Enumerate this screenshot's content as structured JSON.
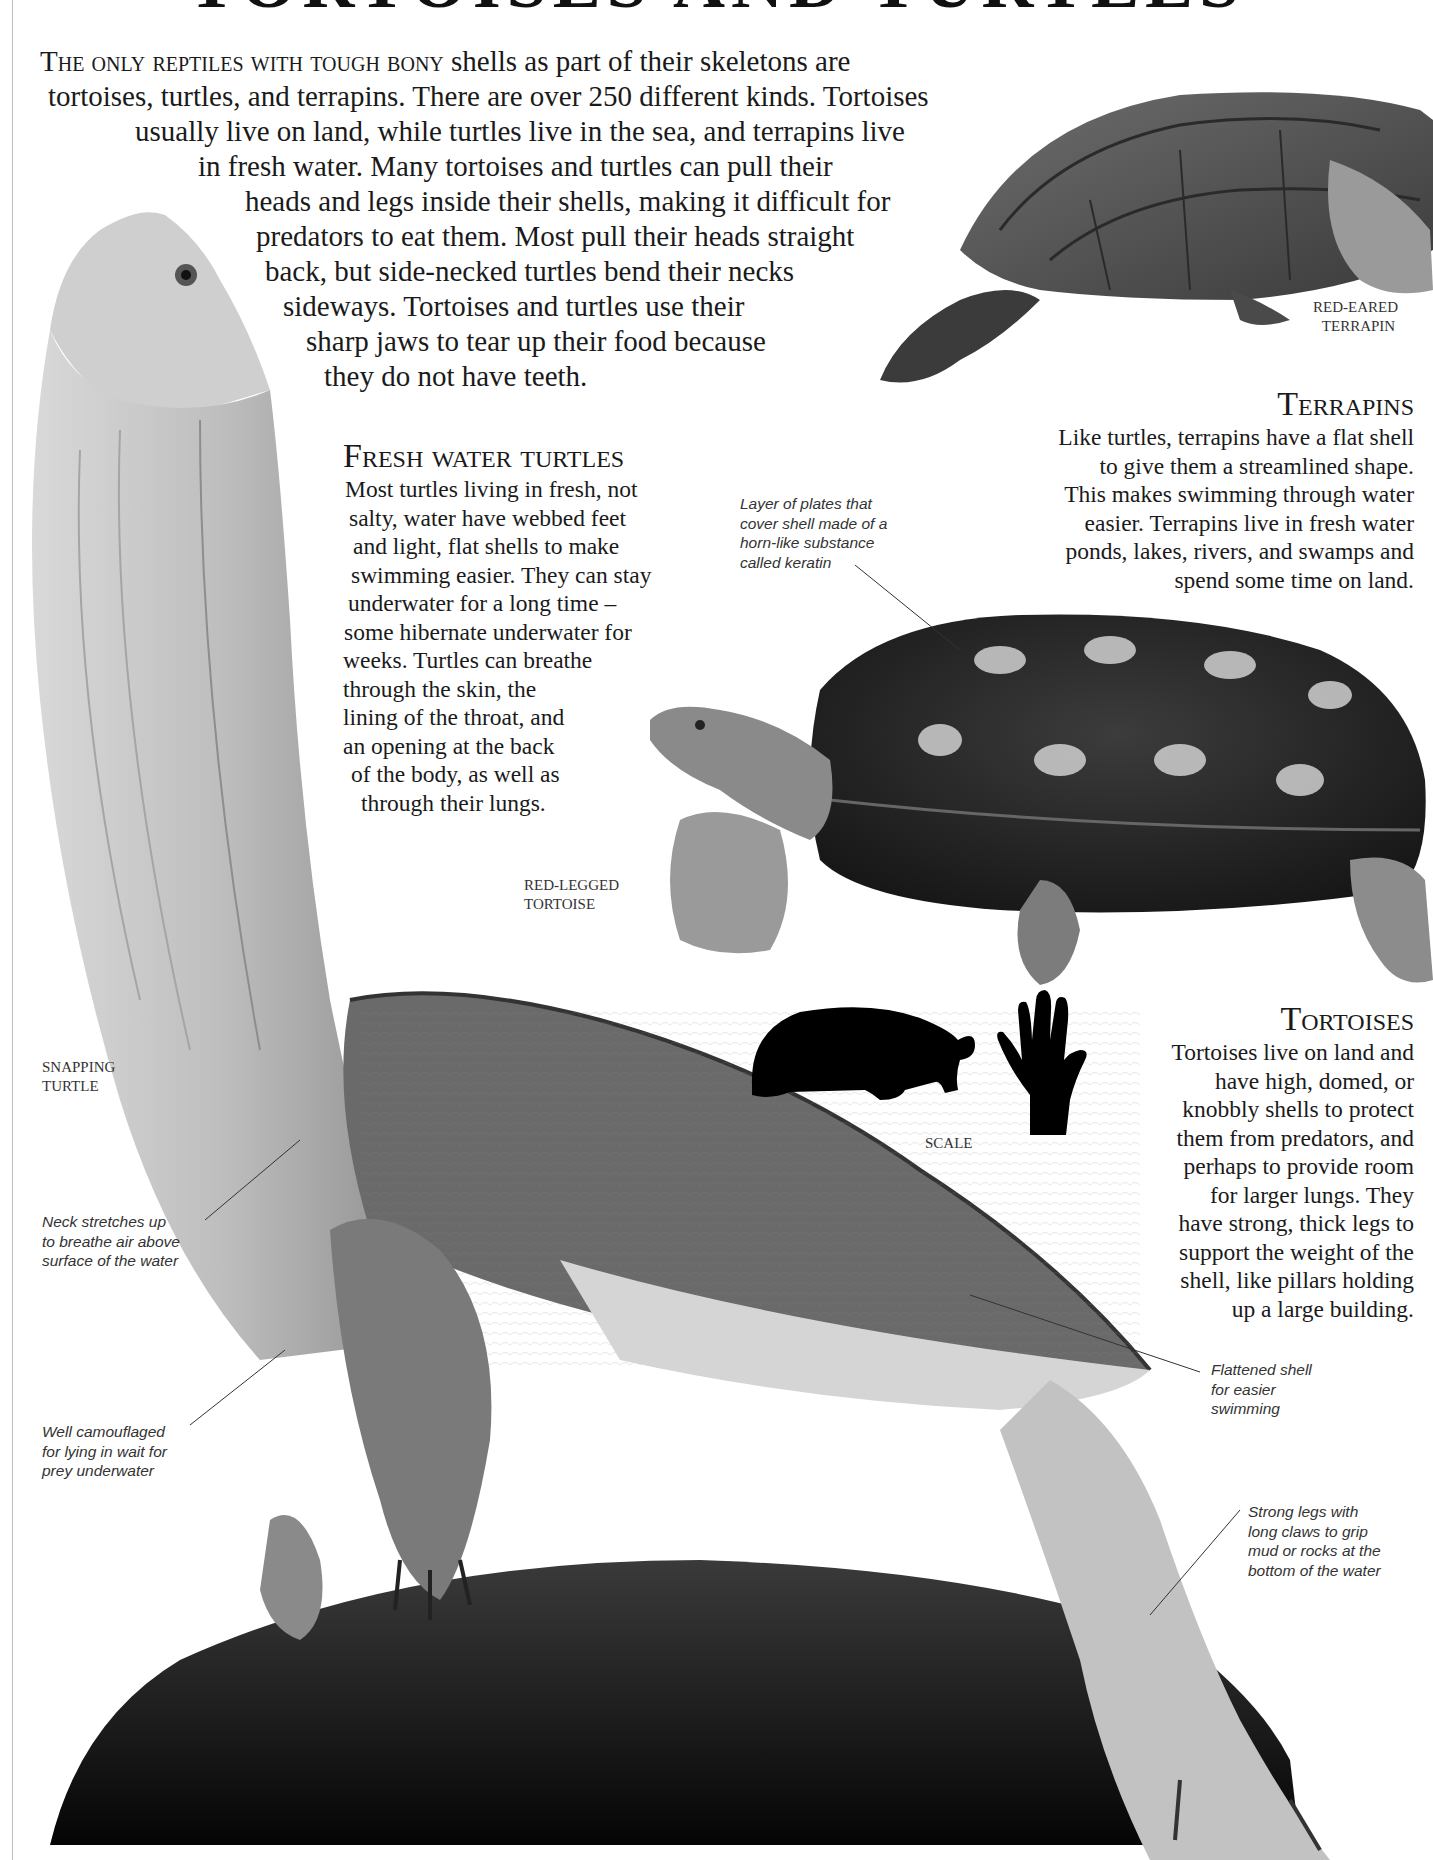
{
  "page": {
    "title": "TORTOISES AND TURTLES"
  },
  "intro": {
    "lead_smallcaps": "The only reptiles with tough bony",
    "line1_rest": " shells as part of their skeletons are",
    "lines": [
      "tortoises, turtles, and terrapins. There are over 250 different kinds. Tortoises",
      "usually live on land, while turtles live in the sea, and terrapins live",
      "in fresh water. Many tortoises and turtles can pull their",
      "heads and legs inside their shells, making it difficult for",
      "predators to eat them. Most pull their heads straight",
      "back, but side-necked turtles bend their necks",
      "sideways. Tortoises and turtles use their",
      "sharp jaws to tear up their food because",
      "they do not have teeth."
    ]
  },
  "sections": {
    "fresh_water": {
      "heading": "Fresh water turtles",
      "lines": [
        "Most turtles living in fresh, not",
        "salty, water have webbed feet",
        "and light, flat shells to make",
        "swimming easier. They can stay",
        "underwater for a long time –",
        "some hibernate underwater for",
        "weeks. Turtles can breathe",
        "through the skin, the",
        "lining of the throat, and",
        "an opening at the back",
        "of the body, as well as",
        "through their lungs."
      ]
    },
    "terrapins": {
      "heading": "Terrapins",
      "lines": [
        "Like turtles, terrapins have a flat shell",
        "to give them a streamlined shape.",
        "This makes swimming through water",
        "easier. Terrapins live in fresh water",
        "ponds, lakes, rivers, and swamps and",
        "spend some time on land."
      ]
    },
    "tortoises": {
      "heading": "Tortoises",
      "lines": [
        "Tortoises live on land and",
        "have high, domed, or",
        "knobbly shells to protect",
        "them from predators, and",
        "perhaps to provide room",
        "for larger lungs. They",
        "have strong, thick legs to",
        "support the weight of the",
        "shell, like pillars holding",
        "up a large building."
      ]
    }
  },
  "captions": {
    "red_eared_terrapin": [
      "Red-eared",
      "terrapin"
    ],
    "red_legged_tortoise": [
      "Red-legged",
      "tortoise"
    ],
    "snapping_turtle": [
      "Snapping",
      "turtle"
    ],
    "scale": "Scale"
  },
  "annotations": {
    "keratin": [
      "Layer of plates that",
      "cover shell made of a",
      "horn-like substance",
      "called keratin"
    ],
    "neck": [
      "Neck stretches up",
      "to breathe air above",
      "surface of the water"
    ],
    "camouflage": [
      "Well camouflaged",
      "for lying in wait for",
      "prey underwater"
    ],
    "flattened_shell": [
      "Flattened shell",
      "for easier",
      "swimming"
    ],
    "strong_legs": [
      "Strong legs with",
      "long claws to grip",
      "mud or rocks at the",
      "bottom of the water"
    ]
  },
  "images": {
    "red_eared_terrapin": "photo-terrapin",
    "red_legged_tortoise": "photo-tortoise",
    "snapping_turtle": "photo-snapping-turtle",
    "scale_silhouette": "tortoise-silhouette-icon",
    "scale_hand": "hand-icon"
  }
}
